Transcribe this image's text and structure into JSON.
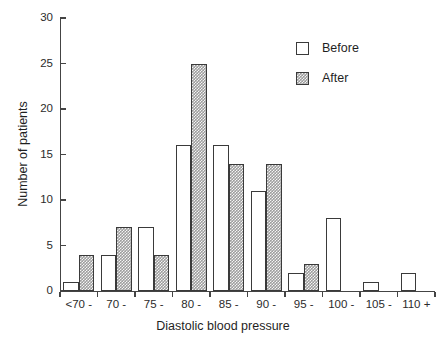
{
  "chart_data": {
    "type": "bar",
    "title": "",
    "xlabel": "Diastolic blood pressure",
    "ylabel": "Number of patients",
    "categories": [
      "<70 -",
      "70 -",
      "75 -",
      "80 -",
      "85 -",
      "90 -",
      "95 -",
      "100 -",
      "105 -",
      "110 +"
    ],
    "series": [
      {
        "name": "Before",
        "values": [
          1,
          4,
          7,
          16,
          16,
          11,
          2,
          8,
          1,
          2
        ]
      },
      {
        "name": "After",
        "values": [
          4,
          7,
          4,
          25,
          14,
          14,
          3,
          0,
          0,
          0
        ]
      }
    ],
    "ylim": [
      0,
      30
    ],
    "yticks": [
      0,
      5,
      10,
      15,
      20,
      25,
      30
    ],
    "ytick_labels": [
      "0",
      "5",
      "10",
      "15",
      "20",
      "25",
      "30"
    ],
    "grid": false,
    "legend_position": "top-right",
    "colors": {
      "before_fill": "#ffffff",
      "after_fill": "#9d9d9d",
      "bar_outline": "#3a3a3a",
      "axis": "#444444",
      "text": "#1f1f1f",
      "background": "#ffffff"
    }
  },
  "legend": {
    "entries": [
      {
        "label": "Before",
        "swatch": "empty-square-swatch"
      },
      {
        "label": "After",
        "swatch": "hatched-square-swatch"
      }
    ]
  }
}
